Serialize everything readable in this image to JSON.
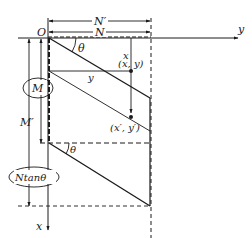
{
  "diagram": {
    "origin_label": "O",
    "x_axis_label": "x",
    "y_axis_label": "y",
    "angle_label_top": "θ",
    "angle_label_bottom": "θ",
    "dim_N_label": "N",
    "dim_N_prime_label": "N′",
    "dim_M_label": "M",
    "dim_M_prime_label": "M′",
    "dim_Ntan_label": "Ntanθ",
    "point_label": "(x, y)",
    "point_prime_label": "(x′, y′)",
    "x_coord_label": "x",
    "y_coord_label": "y",
    "colors": {
      "stroke": "#1a1a1a",
      "background": "#ffffff"
    }
  }
}
